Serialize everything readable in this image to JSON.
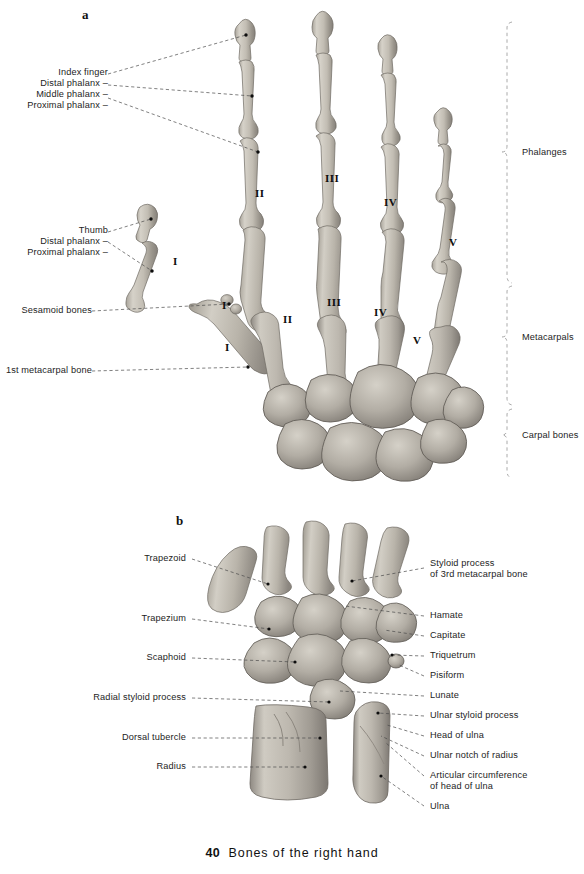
{
  "figure": {
    "caption_number": "40",
    "caption_text": "Bones of the right hand",
    "panel_a_letter": "a",
    "panel_b_letter": "b"
  },
  "panel_a": {
    "letter": "a",
    "view": "dorsal view of right hand skeleton",
    "left_labels": [
      {
        "text": "Index finger",
        "has_dash": false
      },
      {
        "text": "Distal phalanx –",
        "has_dash": true
      },
      {
        "text": "Middle phalanx –",
        "has_dash": true
      },
      {
        "text": "Proximal phalanx –",
        "has_dash": true
      },
      {
        "text": "Thumb",
        "has_dash": false
      },
      {
        "text": "Distal phalanx –",
        "has_dash": true
      },
      {
        "text": "Proximal phalanx –",
        "has_dash": true
      },
      {
        "text": "Sesamoid bones",
        "has_dash": false
      },
      {
        "text": "1st metacarpal bone",
        "has_dash": false
      }
    ],
    "bracket_labels": [
      {
        "text": "Phalanges"
      },
      {
        "text": "Metacarpals"
      },
      {
        "text": "Carpal bones"
      }
    ],
    "phalanx_numerals": [
      "II",
      "III",
      "IV",
      "V"
    ],
    "metacarpal_numerals": [
      "I",
      "II",
      "III",
      "IV",
      "V"
    ],
    "thumb_numeral": "I"
  },
  "panel_b": {
    "letter": "b",
    "view": "dorsal view of right wrist, carpal bones and distal forearm",
    "left_labels": [
      {
        "text": "Trapezoid"
      },
      {
        "text": "Trapezium"
      },
      {
        "text": "Scaphoid"
      },
      {
        "text": "Radial styloid process"
      },
      {
        "text": "Dorsal tubercle"
      },
      {
        "text": "Radius"
      }
    ],
    "right_labels": [
      {
        "text": "Styloid process\nof 3rd metacarpal bone",
        "lines": [
          "Styloid process",
          "of 3rd metacarpal bone"
        ]
      },
      {
        "text": "Hamate",
        "lines": [
          "Hamate"
        ]
      },
      {
        "text": "Capitate",
        "lines": [
          "Capitate"
        ]
      },
      {
        "text": "Triquetrum",
        "lines": [
          "Triquetrum"
        ]
      },
      {
        "text": "Pisiform",
        "lines": [
          "Pisiform"
        ]
      },
      {
        "text": "Lunate",
        "lines": [
          "Lunate"
        ]
      },
      {
        "text": "Ulnar styloid process",
        "lines": [
          "Ulnar styloid process"
        ]
      },
      {
        "text": "Head of ulna",
        "lines": [
          "Head of ulna"
        ]
      },
      {
        "text": "Ulnar notch of radius",
        "lines": [
          "Ulnar notch of radius"
        ]
      },
      {
        "text": "Articular circumference\nof head of ulna",
        "lines": [
          "Articular circumference",
          "of head of ulna"
        ]
      },
      {
        "text": "Ulna",
        "lines": [
          "Ulna"
        ]
      }
    ]
  },
  "colors": {
    "background": "#ffffff",
    "text": "#1d1d1d",
    "leader_line": "#4a4a4a",
    "bracket_line": "#8e8e8e",
    "bone_light": "#d8d4cc",
    "bone_mid": "#b3aea5",
    "bone_dark": "#8d8880",
    "bone_outline": "#6f6a63",
    "marker_dot": "#0c0c0c"
  }
}
